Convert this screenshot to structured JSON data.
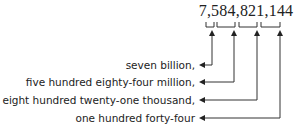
{
  "number": "7,584,821,144",
  "groups": [
    {
      "digits": "7",
      "label": "seven billion,"
    },
    {
      "digits": "584",
      "label": "five hundred eighty-four million,"
    },
    {
      "digits": "821",
      "label": "eight hundred twenty-one thousand,"
    },
    {
      "digits": "144",
      "label": "one hundred forty-four"
    }
  ],
  "colors": {
    "text": "#222222",
    "line": "#333333"
  }
}
